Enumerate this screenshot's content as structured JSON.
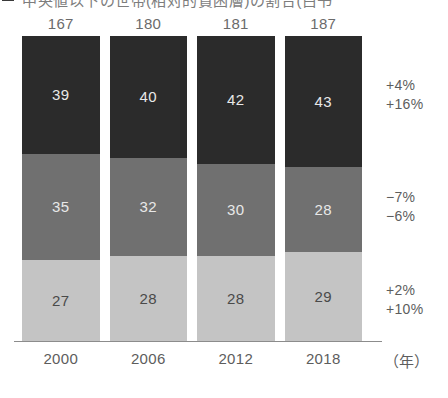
{
  "title": {
    "text": "中央値以下の世帯(相対的貧困層)の割合(白书",
    "marker": "legend-swatch"
  },
  "axis": {
    "unit_label": "（年）",
    "categories": [
      "2000",
      "2006",
      "2012",
      "2018"
    ]
  },
  "totals": [
    "167",
    "180",
    "181",
    "187"
  ],
  "annotations": [
    {
      "name": "top-segment-change",
      "lines": [
        "+4%",
        "+16%"
      ]
    },
    {
      "name": "mid-segment-change",
      "lines": [
        "−7%",
        "−6%"
      ]
    },
    {
      "name": "bottom-segment-change",
      "lines": [
        "+2%",
        "+10%"
      ]
    }
  ],
  "colors": {
    "segment_top": "#2b2b2b",
    "segment_mid": "#707070",
    "segment_bottom": "#c4c4c4",
    "axis": "#8c8c8c",
    "text": "#5d5d5d"
  },
  "chart_data": {
    "type": "bar",
    "subtype": "stacked-100-percent",
    "title": "中央値以下の世帯(相対的貧困層)の割合(白书",
    "xlabel": "（年）",
    "ylabel": "",
    "categories": [
      "2000",
      "2006",
      "2012",
      "2018"
    ],
    "totals": [
      167,
      180,
      181,
      187
    ],
    "series": [
      {
        "name": "top-segment",
        "values": [
          39,
          40,
          42,
          43
        ],
        "color": "#2b2b2b",
        "change": [
          "+4%",
          "+16%"
        ]
      },
      {
        "name": "mid-segment",
        "values": [
          35,
          32,
          30,
          28
        ],
        "color": "#707070",
        "change": [
          "−7%",
          "−6%"
        ]
      },
      {
        "name": "bottom-segment",
        "values": [
          27,
          28,
          28,
          29
        ],
        "color": "#c4c4c4",
        "change": [
          "+2%",
          "+10%"
        ]
      }
    ],
    "stack_order_top_to_bottom": [
      "top-segment",
      "mid-segment",
      "bottom-segment"
    ],
    "grid": false,
    "legend": "none",
    "ylim": [
      0,
      100
    ],
    "value_labels": true
  }
}
